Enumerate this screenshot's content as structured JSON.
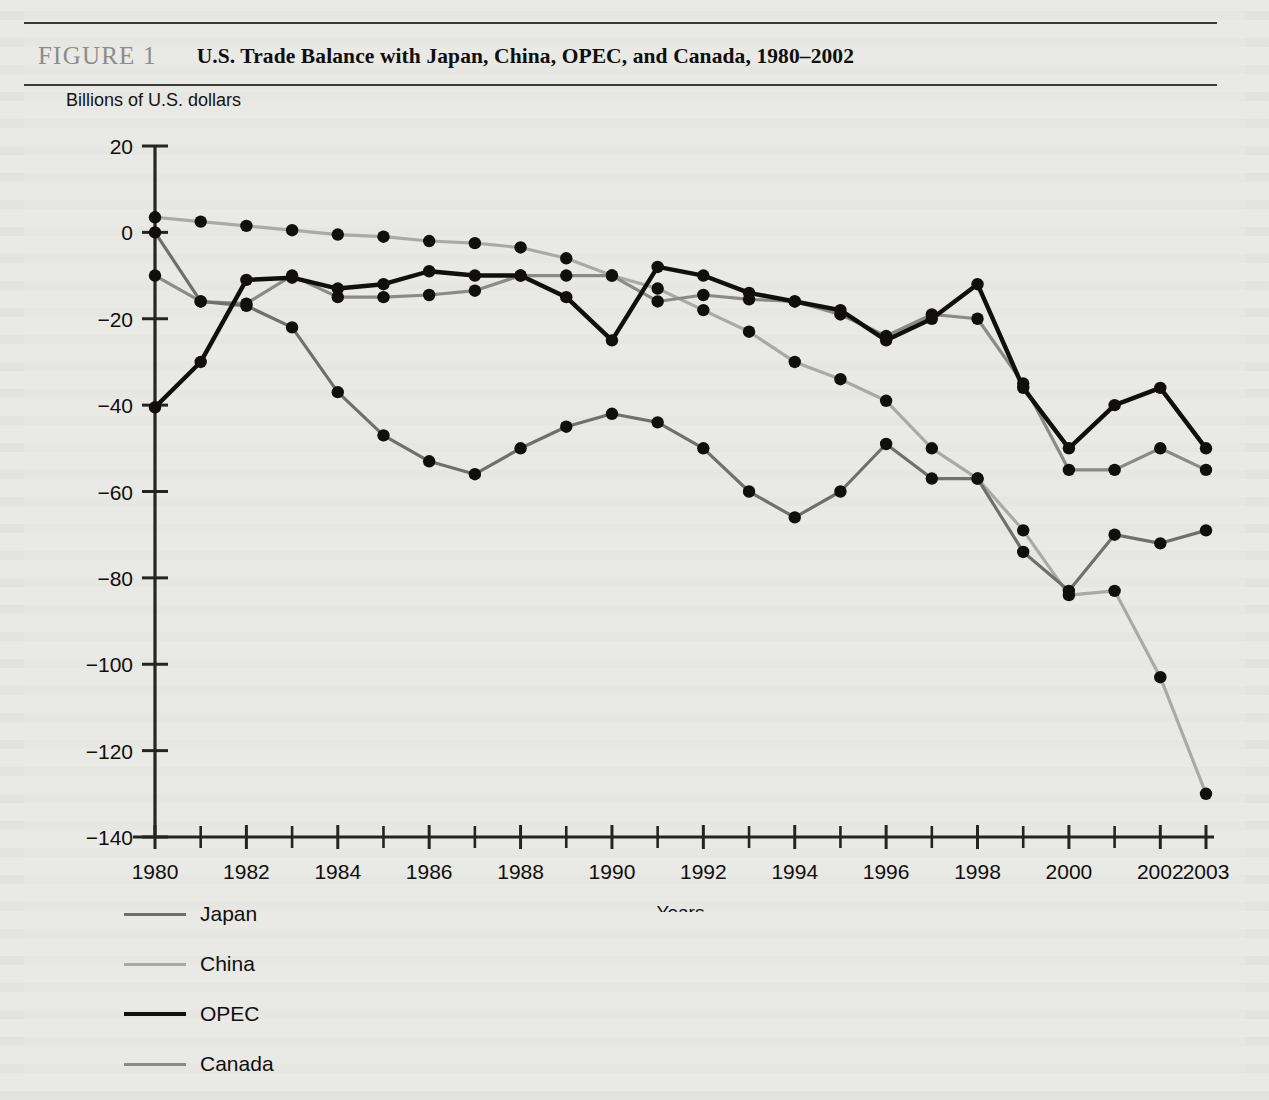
{
  "figure": {
    "label": "FIGURE 1",
    "title": "U.S. Trade Balance with Japan, China, OPEC, and Canada, 1980–2002"
  },
  "axis_title": "Billions of U.S. dollars",
  "legend": {
    "items": [
      {
        "label": "Japan",
        "color": "#6f6f6d",
        "width": 3.2
      },
      {
        "label": "China",
        "color": "#a9a9a6",
        "width": 3.2
      },
      {
        "label": "OPEC",
        "color": "#100f0c",
        "width": 4.4
      },
      {
        "label": "Canada",
        "color": "#8a8a87",
        "width": 3.2
      }
    ]
  },
  "chart_data": {
    "type": "line",
    "title": "U.S. Trade Balance with Japan, China, OPEC, and Canada, 1980–2002",
    "xlabel": "Years",
    "ylabel": "Billions of U.S. dollars",
    "xlim": [
      1980,
      2003
    ],
    "ylim": [
      -140,
      20
    ],
    "yticks": [
      20,
      0,
      -20,
      -40,
      -60,
      -80,
      -100,
      -120,
      -140
    ],
    "ytick_labels": [
      "20",
      "0",
      "−20",
      "−40",
      "−60",
      "−80",
      "−100",
      "−120",
      "−140"
    ],
    "xticks": [
      1980,
      1982,
      1984,
      1986,
      1988,
      1990,
      1992,
      1994,
      1996,
      1998,
      2000,
      2002,
      2003
    ],
    "xtick_labels": [
      "1980",
      "1982",
      "1984",
      "1986",
      "1988",
      "1990",
      "1992",
      "1994",
      "1996",
      "1998",
      "2000",
      "2002",
      "2003"
    ],
    "xtick_minor": [
      1981,
      1983,
      1985,
      1987,
      1989,
      1991,
      1993,
      1995,
      1997,
      1999,
      2001
    ],
    "grid": false,
    "legend_position": "below-left",
    "markers": "filled-circle",
    "x": [
      1980,
      1981,
      1982,
      1983,
      1984,
      1985,
      1986,
      1987,
      1988,
      1989,
      1990,
      1991,
      1992,
      1993,
      1994,
      1995,
      1996,
      1997,
      1998,
      1999,
      2000,
      2001,
      2002,
      2003
    ],
    "series": [
      {
        "name": "Japan",
        "color": "#6f6f6d",
        "values": [
          0,
          -16,
          -17,
          -22,
          -37,
          -47,
          -53,
          -56,
          -50,
          -45,
          -42,
          -44,
          -50,
          -60,
          -66,
          -60,
          -49,
          -57,
          -57,
          -74,
          -83,
          -70,
          -72,
          -69
        ]
      },
      {
        "name": "China",
        "color": "#a9a9a6",
        "values": [
          3.5,
          2.5,
          1.5,
          0.5,
          -0.5,
          -1,
          -2,
          -2.5,
          -3.5,
          -6,
          -10,
          -13,
          -18,
          -23,
          -30,
          -34,
          -39,
          -50,
          -57,
          -69,
          -84,
          -83,
          -103,
          -130
        ]
      },
      {
        "name": "OPEC",
        "color": "#100f0c",
        "values": [
          -40.5,
          -30,
          -11,
          -10.5,
          -13,
          -12,
          -9,
          -10,
          -10,
          -15,
          -25,
          -8,
          -10,
          -14,
          -16,
          -18,
          -25,
          -20,
          -12,
          -36,
          -50,
          -40,
          -36,
          -50
        ]
      },
      {
        "name": "Canada",
        "color": "#8a8a87",
        "values": [
          -10,
          -16,
          -16.5,
          -10,
          -15,
          -15,
          -14.5,
          -13.5,
          -10,
          -10,
          -10,
          -16,
          -14.5,
          -15.5,
          -16,
          -19,
          -24,
          -19,
          -20,
          -35,
          -55,
          -55,
          -50,
          -55
        ]
      }
    ]
  }
}
